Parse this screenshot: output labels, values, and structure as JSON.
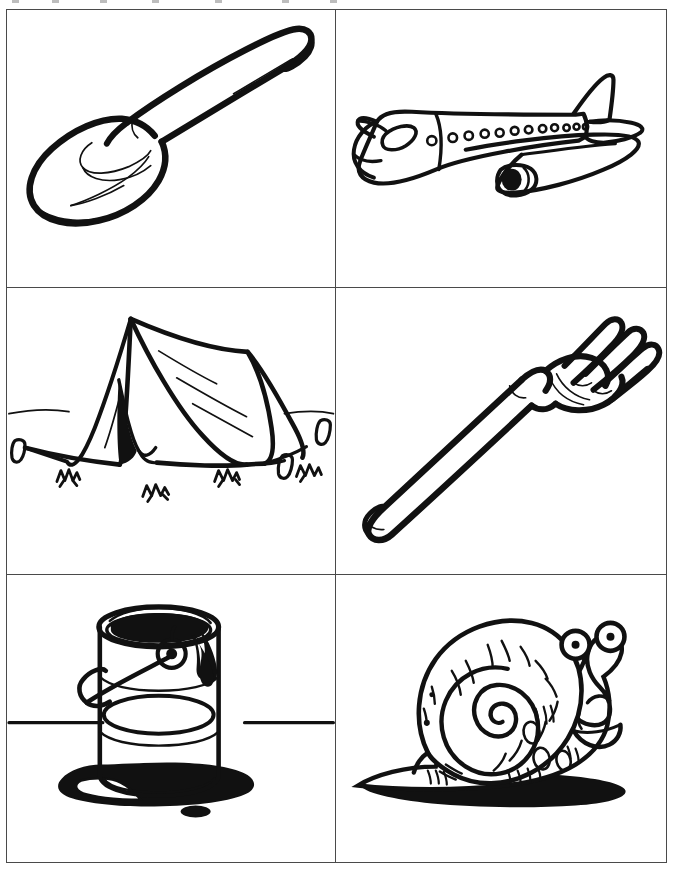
{
  "page": {
    "background_color": "#ffffff",
    "ink_color": "#111111",
    "border_color": "#4a4a4a",
    "width": 673,
    "height": 872,
    "style": "black-and-white line art / coloring page",
    "grid": {
      "columns": 2,
      "rows": 3,
      "cell_count": 6
    }
  },
  "panels": [
    {
      "index": 1,
      "position": "top-left",
      "subject": "spoon",
      "label": "Spoon",
      "description": "Outline drawing of a spoon angled with bowl at lower left and handle toward upper right, with highlight curve inside the bowl.",
      "icon": "spoon-icon"
    },
    {
      "index": 2,
      "position": "top-right",
      "subject": "airplane",
      "label": "Airplane",
      "description": "Outline drawing of a passenger jet airliner in three-quarter view with a row of cabin windows, wings, tail fin and one engine.",
      "icon": "airplane-icon",
      "details": {
        "cabin_windows": 12,
        "cockpit_windows": 1,
        "engines": 1
      }
    },
    {
      "index": 3,
      "position": "middle-left",
      "subject": "tent",
      "label": "Tent",
      "description": "Outline drawing of an A-frame ridge camping tent pegged to the ground with tufts of grass in front.",
      "icon": "tent-icon",
      "details": {
        "pegs": 3,
        "grass_tufts": 4
      }
    },
    {
      "index": 4,
      "position": "middle-right",
      "subject": "fork",
      "label": "Fork",
      "description": "Outline drawing of a fork lying diagonally with the handle at the lower left and four tines at the upper right.",
      "icon": "fork-icon",
      "details": {
        "tines": 4
      }
    },
    {
      "index": 5,
      "position": "bottom-left",
      "subject": "paint can",
      "label": "Paint Can",
      "description": "Outline drawing of an open paint tin with a wire handle, dark paint dripping down the side and a spilled puddle on the ground.",
      "icon": "paint-can-icon"
    },
    {
      "index": 6,
      "position": "bottom-right",
      "subject": "snail",
      "label": "Snail",
      "description": "Cartoon outline drawing of a smiling snail with a spiral shell and two stalked eyes, casting a solid black shadow.",
      "icon": "snail-icon",
      "details": {
        "eye_stalks": 2
      }
    }
  ]
}
